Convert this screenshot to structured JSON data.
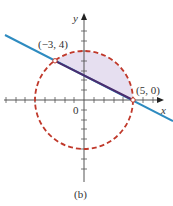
{
  "figure": {
    "caption": "(b)",
    "axes": {
      "x_label": "x",
      "y_label": "y",
      "origin_label": "0",
      "x_ticks": [
        -5,
        -4,
        -3,
        -2,
        -1,
        1,
        2,
        3,
        4,
        5,
        6
      ],
      "y_ticks": [
        -5,
        -4,
        -3,
        -2,
        -1,
        1,
        2,
        3,
        4,
        5,
        6
      ]
    },
    "points": [
      {
        "label": "(−3, 4)",
        "x": -3,
        "y": 4
      },
      {
        "label": "(5, 0)",
        "x": 5,
        "y": 0
      }
    ],
    "circle": {
      "center": [
        0,
        0
      ],
      "radius": 5,
      "style": "dashed",
      "color": "#c0392b"
    },
    "line": {
      "equation": "through (−3,4) and (5,0)",
      "color": "#2e8bc0"
    },
    "chord_color": "#4b2c6e",
    "shaded_region_color": "#e6dff0"
  }
}
